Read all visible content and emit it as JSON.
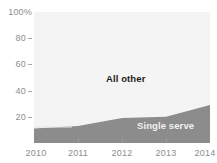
{
  "chart_data": {
    "type": "area",
    "title": "",
    "subtitle": "",
    "xlabel": "",
    "ylabel": "",
    "stacked": true,
    "percent": true,
    "grid": false,
    "legend_position": "inline-labels",
    "x": [
      2010,
      2011,
      2012,
      2013,
      2014
    ],
    "xlim": [
      2010,
      2014
    ],
    "ylim": [
      0,
      100
    ],
    "x_ticks": [
      "2010",
      "2011",
      "2012",
      "2013",
      "2014"
    ],
    "y_ticks": [
      "20",
      "40",
      "60",
      "80"
    ],
    "y_top_label": "100%",
    "series": [
      {
        "name": "Single serve",
        "color": "#8c8c8c",
        "label_color": "#f0f0f0",
        "values": [
          11,
          13,
          19,
          20,
          29
        ]
      },
      {
        "name": "All other",
        "color": "#f4f4f4",
        "label_color": "#1d1d1d",
        "values": [
          89,
          87,
          81,
          80,
          71
        ]
      }
    ],
    "annotations": [
      {
        "text": "All other",
        "x": 2011.2,
        "y": 55
      },
      {
        "text": "Single serve",
        "x": 2013.2,
        "y": 10
      }
    ]
  },
  "axis": {
    "y": {
      "top_label": "100%",
      "ticks": [
        {
          "label": "80",
          "value": 80
        },
        {
          "label": "60",
          "value": 60
        },
        {
          "label": "40",
          "value": 40
        },
        {
          "label": "20",
          "value": 20
        }
      ]
    },
    "x": {
      "ticks": [
        {
          "label": "2010",
          "value": 2010
        },
        {
          "label": "2011",
          "value": 2011
        },
        {
          "label": "2012",
          "value": 2012
        },
        {
          "label": "2013",
          "value": 2013
        },
        {
          "label": "2014",
          "value": 2014
        }
      ]
    }
  },
  "labels": {
    "all_other": "All other",
    "single_serve": "Single serve"
  },
  "colors": {
    "plot_background": "#f4f4f4",
    "page_background": "#ffffff",
    "single_serve_fill": "#8c8c8c",
    "all_other_fill": "#f4f4f4",
    "axis_text": "#8e8e8e",
    "tick_mark": "#9a9a9a"
  }
}
